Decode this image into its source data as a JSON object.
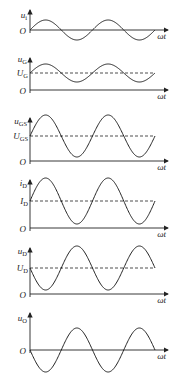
{
  "axis_x_label": "ωt",
  "origin_label": "O",
  "panels": [
    {
      "id": "ui",
      "y_label": {
        "main": "u",
        "sub": "i"
      },
      "dc_label": null,
      "phase": "normal",
      "amplitude": 1.0,
      "dc_level": 0
    },
    {
      "id": "uG",
      "y_label": {
        "main": "u",
        "sub": "G"
      },
      "dc_label": {
        "main": "U",
        "sub": "G"
      },
      "phase": "normal",
      "amplitude": 1.0,
      "dc_level": 1
    },
    {
      "id": "uGS",
      "y_label": {
        "main": "u",
        "sub": "GS"
      },
      "dc_label": {
        "main": "U",
        "sub": "GS"
      },
      "phase": "normal",
      "amplitude": 1.0,
      "dc_level": 1
    },
    {
      "id": "iD",
      "y_label": {
        "main": "i",
        "sub": "D"
      },
      "dc_label": {
        "main": "I",
        "sub": "D"
      },
      "phase": "normal",
      "amplitude": 1.0,
      "dc_level": 1
    },
    {
      "id": "uD",
      "y_label": {
        "main": "u",
        "sub": "D"
      },
      "dc_label": {
        "main": "U",
        "sub": "D"
      },
      "phase": "inverted",
      "amplitude": 1.0,
      "dc_level": 1
    },
    {
      "id": "uO",
      "y_label": {
        "main": "u",
        "sub": "O"
      },
      "dc_label": null,
      "phase": "inverted",
      "amplitude": 1.0,
      "dc_level": 0
    }
  ]
}
